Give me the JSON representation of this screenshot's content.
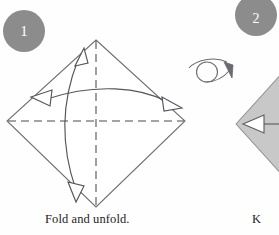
{
  "document": {
    "kind": "origami-instruction-diagram",
    "page_background": "#fefefe"
  },
  "colors": {
    "badge_fill": "#8c8c8c",
    "badge_text": "#ffffff",
    "paper_edge": "#6e6e6e",
    "paper_front_fill": "#ffffff",
    "paper_back_fill": "#c8c8c8",
    "crease_line": "#4a4a4a",
    "arrow_stroke": "#55555a",
    "caption_text": "#1d1d1d"
  },
  "steps": [
    {
      "number": "1",
      "badge_name": "step-number-1",
      "caption": "Fold and unfold.",
      "paper_side": "front",
      "shape": "square rotated 45 degrees (diamond)",
      "diamond": {
        "top_x": 96,
        "top_y": 40,
        "right_x": 185,
        "right_y": 121,
        "bottom_x": 96,
        "bottom_y": 207,
        "left_x": 7,
        "left_y": 121
      },
      "creases": [
        {
          "name": "vertical-center-crease",
          "type": "valley",
          "style": "dashed",
          "orientation": "vertical"
        },
        {
          "name": "horizontal-center-crease",
          "type": "valley",
          "style": "dashed",
          "orientation": "horizontal"
        }
      ],
      "arrows": [
        {
          "name": "vertical-fold-unfold-arrow",
          "heads": 2,
          "head_style": "hollow",
          "direction": "up-and-down",
          "shape": "curved"
        },
        {
          "name": "horizontal-fold-unfold-arrow",
          "heads": 2,
          "head_style": "hollow",
          "direction": "left-and-right",
          "shape": "curved"
        }
      ]
    },
    {
      "number": "2",
      "badge_name": "step-number-2",
      "caption": "K",
      "caption_clipped": true,
      "paper_side": "back",
      "shape": "shaded square rotated 45 degrees (diamond), clipped by page edge",
      "arrows": [
        {
          "name": "fold-direction-arrow",
          "heads": 1,
          "head_style": "hollow",
          "direction": "left",
          "shape": "straight"
        }
      ]
    }
  ],
  "symbols": [
    {
      "name": "turn-over-symbol",
      "meaning": "turn the paper over",
      "icon": "loop-arrow-icon",
      "x": 190,
      "y": 55,
      "width": 42,
      "height": 30
    }
  ]
}
